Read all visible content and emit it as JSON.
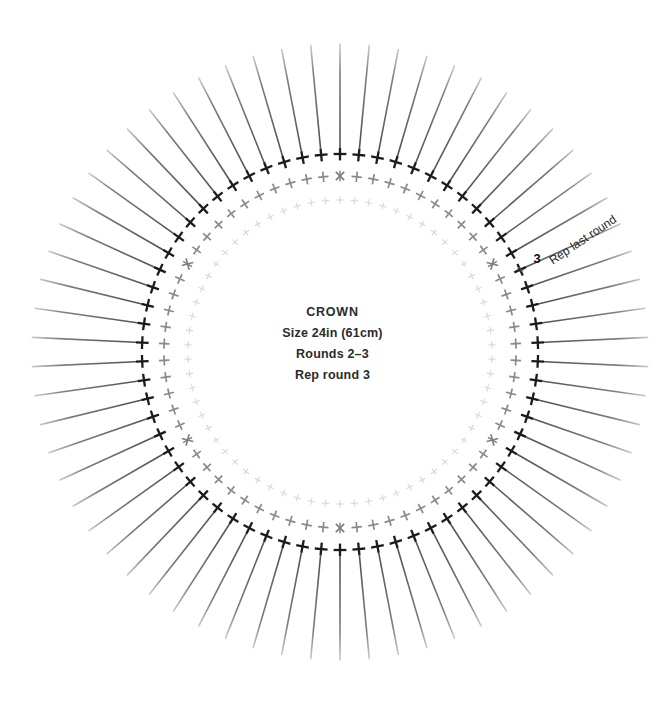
{
  "chart_data": {
    "type": "diagram",
    "diagram_kind": "crochet-round-chart",
    "title": "CROWN",
    "center_text_lines": [
      "CROWN",
      "Size 24in (61cm)",
      "Rounds 2–3",
      "Rep round 3"
    ],
    "geometry": {
      "center_x": 340,
      "center_y": 352,
      "stitch_count": 66,
      "ring_radii": [
        152,
        176,
        198
      ],
      "spoke_inner_radius": 205,
      "spoke_outer_radius": 308
    },
    "rings": [
      {
        "round": 1,
        "label": "",
        "radius": 152,
        "symbol": "cross-stitch",
        "color": "#d8d8d8",
        "stroke_width": 1.1,
        "arm": 3.6
      },
      {
        "round": 2,
        "label": "2",
        "radius": 176,
        "symbol": "cross-stitch",
        "color": "#8a8a8a",
        "stroke_width": 1.7,
        "arm": 5.2
      },
      {
        "round": 3,
        "label": "3",
        "radius": 198,
        "symbol": "cross-stitch",
        "color": "#1b1b1b",
        "stroke_width": 2.3,
        "arm": 6.4
      }
    ],
    "special_markers": {
      "symbol": "x-increase-marker",
      "color": "#7f7f7f",
      "on_ring": 2,
      "count": 6,
      "stitch_indices": [
        0,
        11,
        22,
        33,
        44,
        55
      ]
    },
    "spokes": {
      "symbol": "long-radial-line",
      "color": "#4a4a4a",
      "count": 66,
      "stroke_width_inner": 1.6,
      "stroke_width_outer": 0.5
    },
    "round_labels": [
      {
        "text": "2",
        "round": 2,
        "x": 523,
        "y": 271,
        "color": "#6f6f6f",
        "size": 9,
        "bold": false,
        "rotate": -62
      },
      {
        "text": "3",
        "round": 3,
        "x": 537,
        "y": 263,
        "color": "#111111",
        "size": 13,
        "bold": true,
        "rotate": 0
      }
    ],
    "annotations": [
      {
        "name": "rep-last-round",
        "text": "Rep last round",
        "x": 585,
        "y": 243,
        "rotate": -34,
        "size": 12,
        "color": "#1f1f1f"
      }
    ],
    "colors": {
      "background": "#ffffff",
      "round1": "#d8d8d8",
      "round2": "#8a8a8a",
      "round3": "#1b1b1b",
      "spoke": "#4a4a4a",
      "text": "#2b2b2b",
      "marker": "#7f7f7f"
    }
  }
}
